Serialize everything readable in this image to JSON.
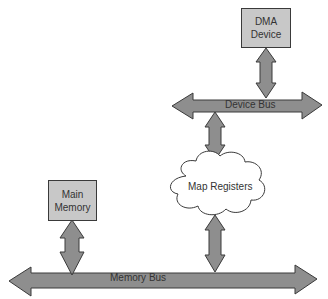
{
  "diagram": {
    "nodes": {
      "dma_device": {
        "line1": "DMA",
        "line2": "Device"
      },
      "main_memory": {
        "line1": "Main",
        "line2": "Memory"
      },
      "map_registers": {
        "label": "Map Registers"
      }
    },
    "buses": {
      "device_bus": {
        "label": "Device Bus"
      },
      "memory_bus": {
        "label": "Memory Bus"
      }
    },
    "colors": {
      "box_fill": "#c8c8c8",
      "arrow_fill": "#8e8e8e",
      "stroke": "#3a3a3a",
      "background": "#ffffff"
    }
  }
}
